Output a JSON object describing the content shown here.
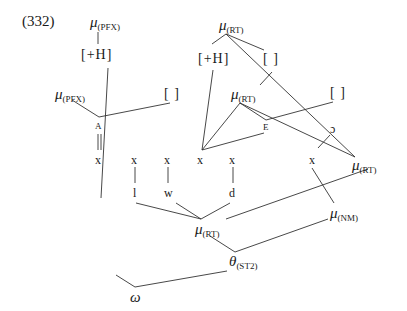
{
  "example_number": "(332)",
  "nodes": {
    "mu_pfx_top": {
      "base": "μ",
      "sub": "(PFX)"
    },
    "h_left": {
      "text": "[+H]"
    },
    "mu_pfx_left": {
      "base": "μ",
      "sub": "(PFX)"
    },
    "empty_left": {
      "text": "[ ]"
    },
    "A": {
      "text": "A"
    },
    "mu_rt_top": {
      "base": "μ",
      "sub": "(RT)"
    },
    "h_right": {
      "text": "[+H]"
    },
    "empty_mid": {
      "text": "[ ]"
    },
    "mu_rt_mid": {
      "base": "μ",
      "sub": "(RT)"
    },
    "empty_right": {
      "text": "[ ]"
    },
    "E": {
      "text": "E"
    },
    "open_o": {
      "text": "ɔ"
    },
    "mu_rt_right": {
      "base": "μ",
      "sub": "(RT)"
    },
    "mu_nm": {
      "base": "μ",
      "sub": "(NM)"
    },
    "mu_rt_bottom": {
      "base": "μ",
      "sub": "(RT)"
    },
    "theta": {
      "base": "θ",
      "sub": "(ST2)"
    },
    "omega": {
      "text": "ω"
    }
  },
  "skeleton": [
    "x",
    "x",
    "x",
    "x",
    "x",
    "x"
  ],
  "segments": [
    "l",
    "w",
    "d"
  ]
}
